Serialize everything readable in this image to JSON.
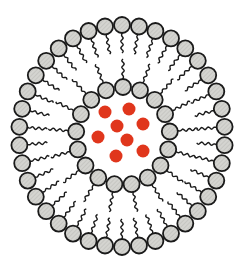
{
  "figure": {
    "title": "Liposome cross-section with encapsulated cargo",
    "width": 244,
    "height": 266,
    "background": "#ffffff"
  },
  "outer_layer": {
    "label": "outer phospholipid leaflet",
    "center": [
      122,
      136
    ],
    "radius_x": 103,
    "radius_y": 111,
    "count": 38,
    "head_radius": 8,
    "tail_length": 20,
    "tails_direction": "inward"
  },
  "inner_layer": {
    "label": "inner phospholipid leaflet",
    "center": [
      123,
      136
    ],
    "radius_x": 47,
    "radius_y": 49,
    "count": 17,
    "head_radius": 8,
    "tail_length": 20,
    "tails_direction": "outward"
  },
  "cargo": {
    "label": "encapsulated drug particles",
    "color": "#e0361c",
    "radius": 6.5,
    "points": [
      [
        105,
        112
      ],
      [
        129,
        109
      ],
      [
        117,
        126
      ],
      [
        143,
        124
      ],
      [
        98,
        137
      ],
      [
        127,
        140
      ],
      [
        116,
        156
      ],
      [
        143,
        151
      ]
    ]
  },
  "colors": {
    "head_fill": "#d4d4d0",
    "head_stroke": "#1a1a1a",
    "tail": "#1a1a1a",
    "hatch": "#b8b8b4"
  }
}
